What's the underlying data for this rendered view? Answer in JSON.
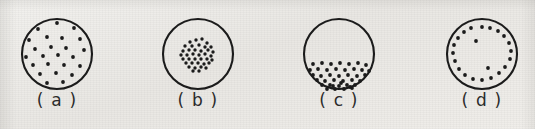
{
  "figure": {
    "background_color": "#eceae6",
    "ink_color": "#1b1b1b",
    "panel_count": 4
  },
  "panels": [
    {
      "id": "panel-a",
      "label": "( a )",
      "letter": "a",
      "pattern": "random-dispersed",
      "circle": {
        "cx": 57,
        "cy": 47,
        "r": 35,
        "stroke_width": 2.1
      },
      "dot_radius": 1.9,
      "dot_count": 24,
      "dots": [
        [
          57,
          16
        ],
        [
          38,
          22
        ],
        [
          74,
          21
        ],
        [
          29,
          33
        ],
        [
          47,
          30
        ],
        [
          62,
          31
        ],
        [
          80,
          32
        ],
        [
          35,
          42
        ],
        [
          51,
          40
        ],
        [
          66,
          41
        ],
        [
          84,
          43
        ],
        [
          26,
          50
        ],
        [
          43,
          49
        ],
        [
          58,
          48
        ],
        [
          73,
          50
        ],
        [
          33,
          58
        ],
        [
          48,
          57
        ],
        [
          64,
          58
        ],
        [
          80,
          59
        ],
        [
          40,
          67
        ],
        [
          56,
          66
        ],
        [
          72,
          68
        ],
        [
          47,
          76
        ],
        [
          63,
          75
        ]
      ]
    },
    {
      "id": "panel-b",
      "label": "( b )",
      "letter": "b",
      "pattern": "center-clustered",
      "circle": {
        "cx": 198,
        "cy": 47,
        "r": 35,
        "stroke_width": 2.1
      },
      "dot_radius": 1.7,
      "dot_count": 38,
      "dots": [
        [
          196,
          33
        ],
        [
          202,
          32
        ],
        [
          190,
          35
        ],
        [
          207,
          36
        ],
        [
          185,
          39
        ],
        [
          192,
          39
        ],
        [
          199,
          38
        ],
        [
          205,
          40
        ],
        [
          211,
          40
        ],
        [
          183,
          44
        ],
        [
          189,
          43
        ],
        [
          195,
          43
        ],
        [
          201,
          44
        ],
        [
          208,
          43
        ],
        [
          213,
          45
        ],
        [
          181,
          48
        ],
        [
          187,
          48
        ],
        [
          193,
          47
        ],
        [
          199,
          48
        ],
        [
          205,
          47
        ],
        [
          211,
          49
        ],
        [
          183,
          52
        ],
        [
          189,
          52
        ],
        [
          195,
          52
        ],
        [
          201,
          52
        ],
        [
          207,
          52
        ],
        [
          212,
          53
        ],
        [
          186,
          56
        ],
        [
          192,
          56
        ],
        [
          198,
          56
        ],
        [
          204,
          57
        ],
        [
          209,
          56
        ],
        [
          189,
          60
        ],
        [
          195,
          61
        ],
        [
          201,
          60
        ],
        [
          206,
          61
        ],
        [
          193,
          64
        ],
        [
          199,
          64
        ]
      ]
    },
    {
      "id": "panel-c",
      "label": "( c )",
      "letter": "c",
      "pattern": "bottom-settled",
      "circle": {
        "cx": 339,
        "cy": 47,
        "r": 35,
        "stroke_width": 2.1
      },
      "dot_radius": 1.9,
      "dot_count": 40,
      "dots": [
        [
          313,
          57
        ],
        [
          322,
          56
        ],
        [
          331,
          57
        ],
        [
          340,
          56
        ],
        [
          349,
          57
        ],
        [
          358,
          56
        ],
        [
          366,
          58
        ],
        [
          310,
          63
        ],
        [
          318,
          62
        ],
        [
          327,
          63
        ],
        [
          336,
          62
        ],
        [
          345,
          63
        ],
        [
          354,
          62
        ],
        [
          362,
          63
        ],
        [
          369,
          64
        ],
        [
          313,
          68
        ],
        [
          321,
          69
        ],
        [
          330,
          68
        ],
        [
          339,
          69
        ],
        [
          348,
          68
        ],
        [
          357,
          69
        ],
        [
          365,
          68
        ],
        [
          317,
          73
        ],
        [
          325,
          74
        ],
        [
          334,
          73
        ],
        [
          343,
          74
        ],
        [
          352,
          73
        ],
        [
          360,
          74
        ],
        [
          322,
          78
        ],
        [
          330,
          78
        ],
        [
          339,
          79
        ],
        [
          347,
          78
        ],
        [
          355,
          78
        ],
        [
          327,
          82
        ],
        [
          335,
          82
        ],
        [
          344,
          82
        ],
        [
          352,
          81
        ],
        [
          333,
          79
        ],
        [
          341,
          76
        ],
        [
          350,
          80
        ]
      ]
    },
    {
      "id": "panel-d",
      "label": "( d )",
      "letter": "d",
      "pattern": "peripheral-ring",
      "circle": {
        "cx": 482,
        "cy": 47,
        "r": 35,
        "stroke_width": 2.1
      },
      "dot_radius": 1.9,
      "dot_count": 22,
      "dots": [
        [
          482,
          20
        ],
        [
          490,
          21
        ],
        [
          498,
          24
        ],
        [
          504,
          29
        ],
        [
          509,
          36
        ],
        [
          511,
          44
        ],
        [
          510,
          52
        ],
        [
          505,
          60
        ],
        [
          499,
          66
        ],
        [
          491,
          71
        ],
        [
          482,
          73
        ],
        [
          473,
          72
        ],
        [
          465,
          68
        ],
        [
          459,
          62
        ],
        [
          455,
          54
        ],
        [
          453,
          46
        ],
        [
          454,
          38
        ],
        [
          458,
          31
        ],
        [
          464,
          25
        ],
        [
          471,
          21
        ],
        [
          476,
          34
        ],
        [
          488,
          61
        ]
      ]
    }
  ]
}
